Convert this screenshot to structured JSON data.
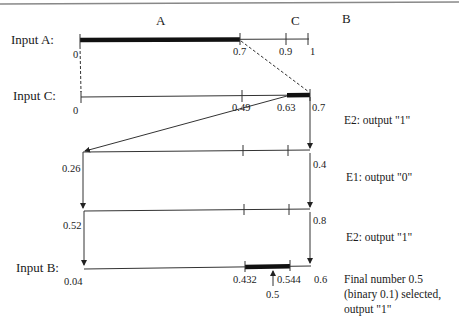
{
  "header": {
    "label_A": "A",
    "label_C": "C",
    "label_B": "B"
  },
  "rows": {
    "input_a": {
      "label": "Input A:",
      "ticks": [
        "0",
        "0.7",
        "0.9",
        "1"
      ]
    },
    "input_c": {
      "label": "Input C:",
      "ticks": [
        "0",
        "0.49",
        "0.63",
        "0.7"
      ]
    },
    "row3": {
      "ticks": [
        "0.26",
        "0.4"
      ]
    },
    "row4": {
      "ticks": [
        "0.52",
        "0.8"
      ]
    },
    "input_b": {
      "label": "Input B:",
      "ticks": [
        "0.04",
        "0.432",
        "0.544",
        "0.6",
        "0.5"
      ]
    }
  },
  "steps": [
    {
      "text": "E2: output \"1\""
    },
    {
      "text": "E1: output \"0\""
    },
    {
      "text": "E2: output \"1\""
    }
  ],
  "final": {
    "line1": "Final number 0.5",
    "line2": "(binary 0.1) selected,",
    "line3": "output \"1\""
  },
  "colors": {
    "line": "#333333",
    "bar": "#111111",
    "rule": "#888888"
  }
}
